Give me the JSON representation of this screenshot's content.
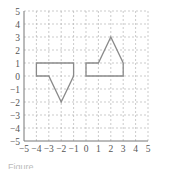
{
  "chart_data": {
    "type": "line",
    "title": "",
    "xlabel": "",
    "ylabel": "",
    "xlim": [
      -5,
      5
    ],
    "ylim": [
      -5,
      5
    ],
    "grid": true,
    "grid_style": "dashed",
    "x_ticks": [
      -5,
      -4,
      -3,
      -2,
      -1,
      0,
      1,
      2,
      3,
      4,
      5
    ],
    "y_ticks": [
      -5,
      -4,
      -3,
      -2,
      -1,
      0,
      1,
      2,
      3,
      4,
      5
    ],
    "x_tick_labels": [
      "-5",
      "-4",
      "-3",
      "-2",
      "-1",
      "0",
      "1",
      "2",
      "3",
      "4",
      "5"
    ],
    "y_tick_labels": [
      "-5",
      "-4",
      "-3",
      "-2",
      "-1",
      "0",
      "1",
      "2",
      "3",
      "4",
      "5"
    ],
    "series": [
      {
        "name": "left-polygon",
        "closed": true,
        "points": [
          [
            -4,
            1
          ],
          [
            -1,
            1
          ],
          [
            -1,
            0
          ],
          [
            -2,
            -2
          ],
          [
            -3,
            0
          ],
          [
            -4,
            0
          ]
        ]
      },
      {
        "name": "right-polygon",
        "closed": true,
        "points": [
          [
            0,
            0
          ],
          [
            0,
            1
          ],
          [
            1,
            1
          ],
          [
            2,
            3
          ],
          [
            3,
            1
          ],
          [
            3,
            0
          ]
        ]
      }
    ],
    "colors": {
      "shape_stroke": "#8a8a8a",
      "grid": "#b5b5b5",
      "axis": "#777777",
      "text": "#555555"
    }
  },
  "caption": "Figure"
}
